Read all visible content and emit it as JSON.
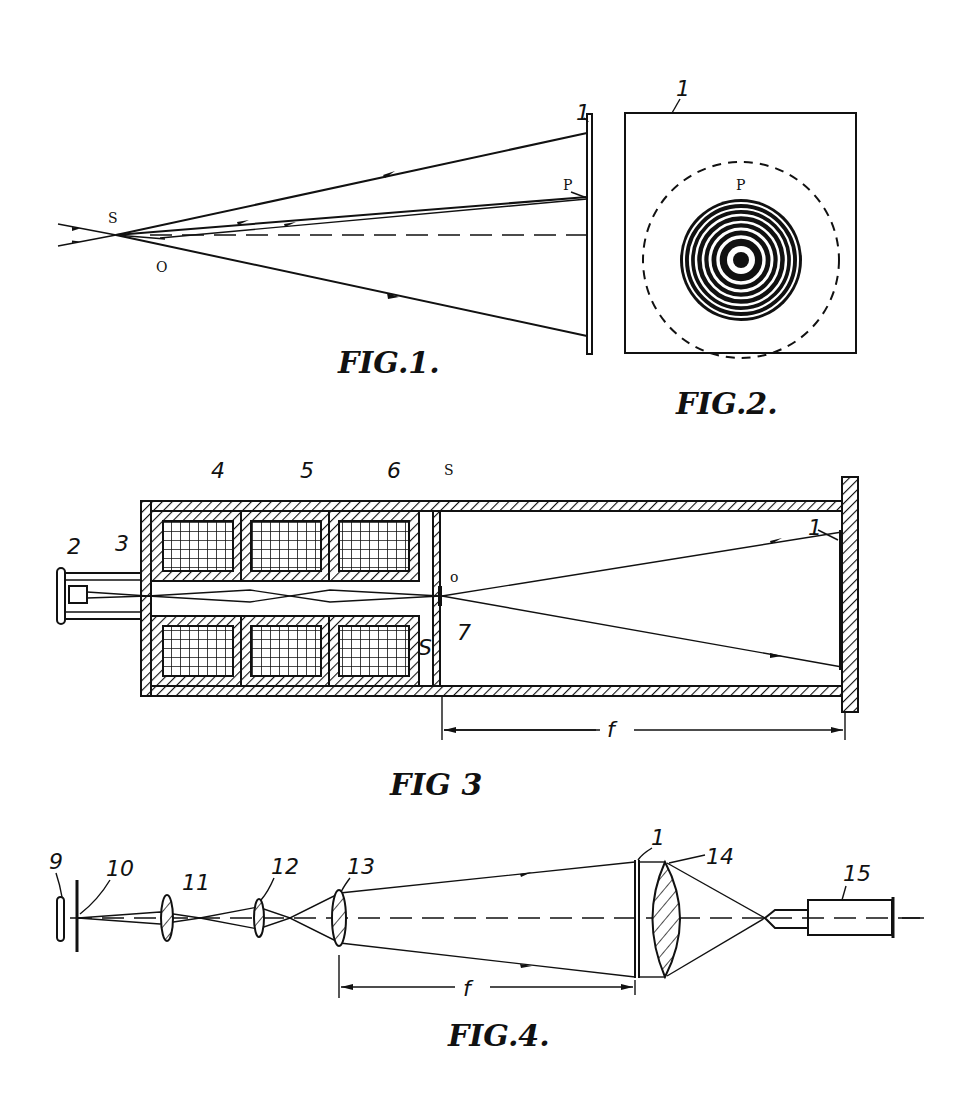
{
  "sheet": {
    "type": "patent drawing sheet",
    "figures": [
      {
        "id": "fig1",
        "caption": "FIG.1.",
        "labels": {
          "source": "S",
          "point": "P",
          "origin": "O",
          "screen": "1"
        },
        "description": "Rays diverging from point S to screen 1; dashed optical axis; ray to point P"
      },
      {
        "id": "fig2",
        "caption": "FIG.2.",
        "labels": {
          "screen": "1",
          "point": "P"
        },
        "description": "Square screen with dashed circle and concentric ring (zone-plate) pattern centred below P",
        "rings": 8
      },
      {
        "id": "fig3",
        "caption": "FIG 3",
        "labels": {
          "source": "2",
          "aperture": "3",
          "lens_a": "4",
          "lens_b": "5",
          "lens_c": "6",
          "object": "7",
          "screen": "1",
          "point_top": "S",
          "point_bottom": "S",
          "origin": "o",
          "focal_length": "f"
        },
        "description": "Cylindrical housing with three electromagnetic lens coils, beam focused at 7, diverging to screen 1"
      },
      {
        "id": "fig4",
        "caption": "FIG.4.",
        "labels": {
          "lamp": "9",
          "slit": "10",
          "lens_11": "11",
          "lens_12": "12",
          "lens_13": "13",
          "plate": "1",
          "lens_14": "14",
          "eyepiece": "15",
          "focal_length": "f"
        },
        "description": "Optical reconstruction train: lamp 9, slit 10, lenses 11-13, plate 1, lens 14, viewer 15"
      }
    ]
  }
}
